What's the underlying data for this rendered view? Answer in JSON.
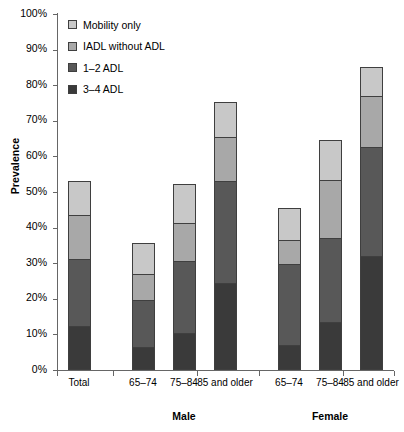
{
  "chart_data": {
    "type": "bar",
    "stacked": true,
    "title": "",
    "xlabel": "",
    "ylabel": "Prevalence",
    "ylim": [
      0,
      100
    ],
    "ytick_labels": [
      "0%",
      "10%",
      "20%",
      "30%",
      "40%",
      "50%",
      "60%",
      "70%",
      "80%",
      "90%",
      "100%"
    ],
    "ytick_values": [
      0,
      10,
      20,
      30,
      40,
      50,
      60,
      70,
      80,
      90,
      100
    ],
    "grid": false,
    "legend_position": "top-left",
    "categories": [
      "Total",
      "65–74",
      "75–84",
      "85 and older",
      "65–74",
      "75–84",
      "85 and older"
    ],
    "groups": [
      {
        "label": "",
        "categories": [
          "Total"
        ]
      },
      {
        "label": "Male",
        "categories": [
          "65–74",
          "75–84",
          "85 and older"
        ]
      },
      {
        "label": "Female",
        "categories": [
          "65–74",
          "75–84",
          "85 and older"
        ]
      }
    ],
    "series": [
      {
        "name": "3–4 ADL",
        "color": "#3a3a3a",
        "values": [
          12.5,
          6.5,
          10.5,
          24.5,
          7.0,
          13.5,
          32.0
        ]
      },
      {
        "name": "1–2 ADL",
        "color": "#585858",
        "values": [
          19.0,
          13.5,
          20.5,
          29.0,
          23.0,
          24.0,
          31.0
        ]
      },
      {
        "name": "IADL without ADL",
        "color": "#a8a8a8",
        "values": [
          12.5,
          7.5,
          11.0,
          12.5,
          7.0,
          16.5,
          14.5
        ]
      },
      {
        "name": "Mobility only",
        "color": "#c8c8c8",
        "values": [
          10.0,
          9.0,
          11.0,
          10.0,
          9.5,
          11.5,
          8.5
        ]
      }
    ],
    "totals": [
      54.0,
      36.5,
      53.0,
      76.0,
      46.5,
      65.5,
      86.0
    ]
  },
  "legend": {
    "items": [
      {
        "label": "Mobility only",
        "color": "#c8c8c8"
      },
      {
        "label": "IADL without ADL",
        "color": "#a8a8a8"
      },
      {
        "label": "1–2 ADL",
        "color": "#585858"
      },
      {
        "label": "3–4 ADL",
        "color": "#3a3a3a"
      }
    ]
  }
}
